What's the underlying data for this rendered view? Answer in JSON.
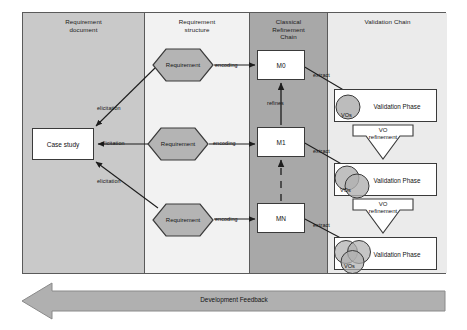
{
  "diagram": {
    "panes": [
      {
        "id": "requirement-document",
        "label": "Requirement\ndocument",
        "line1": "Requirement",
        "line2": "document",
        "fill": "#c9c9c9"
      },
      {
        "id": "requirement-structure",
        "label": "Requirement\nstructure",
        "line1": "Requirement",
        "line2": "structure",
        "fill": "#f2f2f2"
      },
      {
        "id": "classical-refinement-chain",
        "label": "Classical\nRefinement\nChain",
        "line1": "Classical",
        "line2": "Refinement",
        "line3": "Chain",
        "fill": "#a8a8a8"
      },
      {
        "id": "validation-chain",
        "label": "Validation Chain",
        "line1": "Validation Chain",
        "fill": "#ebebeb"
      }
    ],
    "case_study": {
      "label": "Case study"
    },
    "requirements": [
      {
        "label": "Requirement"
      },
      {
        "label": "Requirement"
      },
      {
        "label": "Requirement"
      }
    ],
    "models": [
      {
        "label": "M0"
      },
      {
        "label": "M1"
      },
      {
        "label": "MN"
      }
    ],
    "validation_phases": [
      {
        "label": "Validation Phase",
        "vo_label": "VOs",
        "circles": 1
      },
      {
        "label": "Validation Phase",
        "vo_label": "VOs",
        "circles": 2
      },
      {
        "label": "Validation Phase",
        "vo_label": "VOs",
        "circles": 3
      }
    ],
    "vo_refinements": [
      {
        "line1": "VO",
        "line2": "refinement"
      },
      {
        "line1": "VO",
        "line2": "refinement"
      }
    ],
    "edge_labels": {
      "elicitation_top": "elicitation",
      "elicitation_mid": "elicitation",
      "elicitation_bottom": "elicitation",
      "encoding_top": "encoding",
      "encoding_mid": "encoding",
      "encoding_bottom": "encoding",
      "refines": "refines",
      "extract_top": "extract",
      "extract_mid": "extract",
      "extract_bottom": "extract"
    },
    "feedback_arrow": {
      "label": "Development Feedback"
    },
    "colors": {
      "pane_dark": "#a8a8a8",
      "pane_mid": "#c9c9c9",
      "pane_light": "#f2f2f2",
      "pane_lighter": "#ebebeb",
      "shape_fill": "#b4b4b4",
      "stroke": "#3a3a3a",
      "arrow_fill": "#b0b0b0"
    }
  }
}
